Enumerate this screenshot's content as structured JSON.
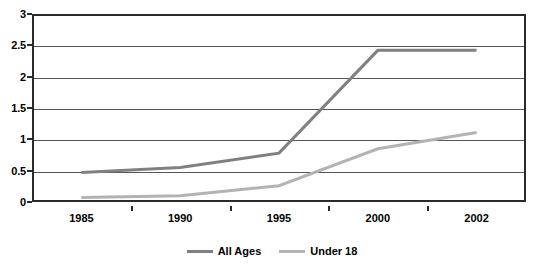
{
  "chart_data": {
    "type": "line",
    "title": "",
    "xlabel": "",
    "ylabel": "",
    "categories": [
      "1985",
      "1990",
      "1995",
      "2000",
      "2002"
    ],
    "ylim": [
      0,
      3
    ],
    "y_ticks": [
      "0",
      "0.5",
      "1",
      "1.5",
      "2",
      "2.5",
      "3"
    ],
    "y_tick_values": [
      0,
      0.5,
      1,
      1.5,
      2,
      2.5,
      3
    ],
    "grid": true,
    "legend_position": "bottom",
    "series": [
      {
        "name": "All Ages",
        "color": "#808080",
        "values": [
          0.47,
          0.55,
          0.78,
          2.42,
          2.42
        ]
      },
      {
        "name": "Under 18",
        "color": "#b3b3b3",
        "values": [
          0.07,
          0.1,
          0.26,
          0.85,
          1.11
        ]
      }
    ]
  },
  "legend": {
    "entries": [
      {
        "label": "All Ages",
        "color": "#808080"
      },
      {
        "label": "Under 18",
        "color": "#b3b3b3"
      }
    ]
  },
  "axes": {
    "y_labels": [
      "3",
      "2.5",
      "2",
      "1.5",
      "1",
      "0.5",
      "0"
    ],
    "x_labels": [
      "1985",
      "1990",
      "1995",
      "2000",
      "2002"
    ]
  }
}
